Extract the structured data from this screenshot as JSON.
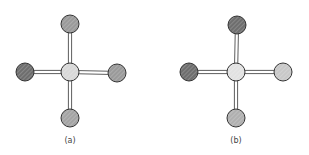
{
  "diagram": {
    "panels": [
      {
        "label": "(a)",
        "center": {
          "x": 70,
          "y": 72,
          "shade": "light",
          "fill": "#d8d8d8"
        },
        "atoms": [
          {
            "position": "top",
            "x": 70,
            "y": 24,
            "shade": "medium",
            "fill": "#9a9a9a"
          },
          {
            "position": "left",
            "x": 25,
            "y": 72,
            "shade": "dark",
            "fill": "#6e6e6e"
          },
          {
            "position": "right",
            "x": 117,
            "y": 73,
            "shade": "medium",
            "fill": "#9a9a9a"
          },
          {
            "position": "bottom",
            "x": 70,
            "y": 118,
            "shade": "medium",
            "fill": "#a4a4a4"
          }
        ]
      },
      {
        "label": "(b)",
        "center": {
          "x": 236,
          "y": 72,
          "shade": "light",
          "fill": "#e2e2e2"
        },
        "atoms": [
          {
            "position": "top",
            "x": 237,
            "y": 25,
            "shade": "dark",
            "fill": "#6e6e6e"
          },
          {
            "position": "left",
            "x": 189,
            "y": 72,
            "shade": "dark",
            "fill": "#6e6e6e"
          },
          {
            "position": "right",
            "x": 283,
            "y": 72,
            "shade": "light",
            "fill": "#c8c8c8"
          },
          {
            "position": "bottom",
            "x": 236,
            "y": 118,
            "shade": "medium",
            "fill": "#b0b0b0"
          }
        ]
      }
    ],
    "atom_radius": 9,
    "bond_style": "double-line",
    "stroke_color": "#333333"
  }
}
